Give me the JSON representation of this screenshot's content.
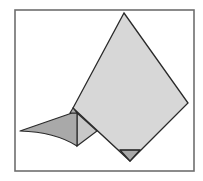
{
  "figure": {
    "width": 203,
    "height": 181,
    "background": "#ffffff",
    "frame": {
      "x": 15,
      "y": 10,
      "width": 179,
      "height": 161,
      "stroke": "#6e6e6e",
      "stroke_width": 1.6
    },
    "colors": {
      "light_fill": "#d7d7d7",
      "mid_fill": "#c8c8c8",
      "dark_fill": "#a9a9a9",
      "edge": "#2a2a2a"
    },
    "shapes": {
      "kite": "124,13 188,103 130,161 73,108",
      "bottom_tip": "120,150 140,150 130,161",
      "left_notch": "73,108 70,113 77,113",
      "inner_triangle": "77,113 97,131 77,146",
      "wing_path": "M20,131 L72,113 L77,113 L77,146 Q55,132 20,131 Z",
      "tip_line": "M120,150 L140,150"
    }
  }
}
